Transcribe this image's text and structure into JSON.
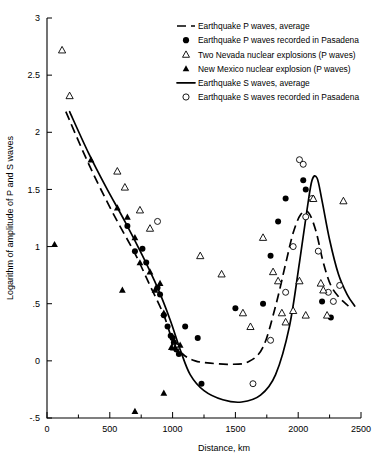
{
  "chart_data": {
    "type": "scatter",
    "title": "",
    "xlabel": "Distance, km",
    "ylabel": "Logarithm of amplitude of P and S waves",
    "xlim": [
      0,
      2500
    ],
    "ylim": [
      -0.5,
      3
    ],
    "xticks": [
      0,
      500,
      1000,
      1500,
      2000,
      2500
    ],
    "xtick_labels": [
      "0",
      "500",
      "1000",
      "1500",
      "2000",
      "2500"
    ],
    "xminor_step": 250,
    "yticks": [
      -0.5,
      0,
      0.5,
      1,
      1.5,
      2,
      2.5,
      3
    ],
    "ytick_labels": [
      "-.5",
      "0",
      ".5",
      "1",
      "1.5",
      "2",
      "2.5",
      "3"
    ],
    "grid": false,
    "legend_position": "top-right",
    "legend": [
      {
        "key": "p-average",
        "marker": "dashed-line",
        "label": "Earthquake P waves, average"
      },
      {
        "key": "p-pasadena",
        "marker": "filled-circle",
        "label": "Earthquake P waves recorded in Pasadena"
      },
      {
        "key": "nevada",
        "marker": "open-triangle",
        "label": "Two Nevada nuclear explosions (P waves)"
      },
      {
        "key": "new-mexico",
        "marker": "filled-triangle",
        "label": "New Mexico nuclear explosion (P waves)"
      },
      {
        "key": "s-average",
        "marker": "solid-line",
        "label": "Earthquake S waves, average"
      },
      {
        "key": "s-pasadena",
        "marker": "open-circle",
        "label": "Earthquake S waves recorded in Pasadena"
      }
    ],
    "series": [
      {
        "name": "Earthquake P waves, average",
        "key": "p-average",
        "type": "line",
        "style": "dashed",
        "points": [
          [
            150,
            2.18
          ],
          [
            300,
            1.8
          ],
          [
            420,
            1.52
          ],
          [
            560,
            1.22
          ],
          [
            700,
            0.94
          ],
          [
            820,
            0.66
          ],
          [
            930,
            0.4
          ],
          [
            1000,
            0.18
          ],
          [
            1080,
            0.06
          ],
          [
            1180,
            0.0
          ],
          [
            1300,
            -0.02
          ],
          [
            1450,
            -0.03
          ],
          [
            1600,
            -0.01
          ],
          [
            1720,
            0.12
          ],
          [
            1820,
            0.48
          ],
          [
            1900,
            0.85
          ],
          [
            1960,
            1.12
          ],
          [
            2020,
            1.28
          ],
          [
            2080,
            1.3
          ],
          [
            2140,
            1.14
          ],
          [
            2200,
            0.86
          ],
          [
            2260,
            0.66
          ],
          [
            2330,
            0.55
          ],
          [
            2400,
            0.48
          ]
        ]
      },
      {
        "name": "Earthquake S waves, average",
        "key": "s-average",
        "type": "line",
        "style": "solid",
        "points": [
          [
            180,
            2.18
          ],
          [
            330,
            1.82
          ],
          [
            470,
            1.52
          ],
          [
            620,
            1.22
          ],
          [
            760,
            0.92
          ],
          [
            880,
            0.64
          ],
          [
            980,
            0.36
          ],
          [
            1060,
            0.1
          ],
          [
            1140,
            -0.12
          ],
          [
            1250,
            -0.26
          ],
          [
            1400,
            -0.34
          ],
          [
            1550,
            -0.36
          ],
          [
            1700,
            -0.3
          ],
          [
            1820,
            -0.12
          ],
          [
            1930,
            0.3
          ],
          [
            2010,
            0.86
          ],
          [
            2070,
            1.32
          ],
          [
            2110,
            1.58
          ],
          [
            2150,
            1.6
          ],
          [
            2190,
            1.4
          ],
          [
            2250,
            1.06
          ],
          [
            2320,
            0.76
          ],
          [
            2390,
            0.58
          ],
          [
            2450,
            0.48
          ]
        ]
      },
      {
        "name": "Earthquake P waves recorded in Pasadena",
        "key": "p-pasadena",
        "type": "scatter",
        "marker": "filled-circle",
        "points": [
          [
            640,
            1.18
          ],
          [
            700,
            0.96
          ],
          [
            760,
            0.98
          ],
          [
            790,
            0.86
          ],
          [
            880,
            0.64
          ],
          [
            900,
            0.58
          ],
          [
            930,
            0.4
          ],
          [
            960,
            0.3
          ],
          [
            985,
            0.22
          ],
          [
            1000,
            0.2
          ],
          [
            1010,
            0.16
          ],
          [
            1015,
            0.14
          ],
          [
            1030,
            0.1
          ],
          [
            1050,
            0.06
          ],
          [
            1100,
            0.3
          ],
          [
            1200,
            0.2
          ],
          [
            1230,
            -0.2
          ],
          [
            1500,
            0.46
          ],
          [
            1720,
            0.5
          ],
          [
            1780,
            0.92
          ],
          [
            1840,
            1.22
          ],
          [
            1900,
            1.42
          ],
          [
            2040,
            1.58
          ],
          [
            2060,
            1.5
          ],
          [
            2190,
            0.52
          ],
          [
            2260,
            0.38
          ]
        ]
      },
      {
        "name": "Earthquake S waves recorded in Pasadena",
        "key": "s-pasadena",
        "type": "scatter",
        "marker": "open-circle",
        "points": [
          [
            880,
            1.22
          ],
          [
            1030,
            0.12
          ],
          [
            1640,
            -0.2
          ],
          [
            1780,
            0.18
          ],
          [
            1900,
            0.6
          ],
          [
            1960,
            1.0
          ],
          [
            2010,
            1.76
          ],
          [
            2040,
            1.72
          ],
          [
            2060,
            1.26
          ],
          [
            2110,
            1.42
          ],
          [
            2160,
            0.96
          ],
          [
            2240,
            0.6
          ],
          [
            2280,
            0.52
          ],
          [
            2330,
            0.66
          ]
        ]
      },
      {
        "name": "Two Nevada nuclear explosions (P waves)",
        "key": "nevada",
        "type": "scatter",
        "marker": "open-triangle",
        "points": [
          [
            120,
            2.72
          ],
          [
            180,
            2.32
          ],
          [
            560,
            1.66
          ],
          [
            620,
            1.52
          ],
          [
            740,
            1.32
          ],
          [
            820,
            1.16
          ],
          [
            1010,
            0.12
          ],
          [
            1220,
            0.92
          ],
          [
            1390,
            0.76
          ],
          [
            1560,
            0.42
          ],
          [
            1620,
            0.3
          ],
          [
            1720,
            1.08
          ],
          [
            1800,
            0.78
          ],
          [
            1840,
            0.7
          ],
          [
            1870,
            0.42
          ],
          [
            1900,
            0.34
          ],
          [
            1960,
            0.44
          ],
          [
            2010,
            0.7
          ],
          [
            2060,
            0.4
          ],
          [
            2120,
            1.42
          ],
          [
            2180,
            0.68
          ],
          [
            2200,
            0.62
          ],
          [
            2360,
            1.4
          ],
          [
            2230,
            0.4
          ]
        ]
      },
      {
        "name": "New Mexico nuclear explosion (P waves)",
        "key": "new-mexico",
        "type": "scatter",
        "marker": "filled-triangle",
        "points": [
          [
            60,
            1.02
          ],
          [
            350,
            1.76
          ],
          [
            560,
            1.34
          ],
          [
            640,
            1.26
          ],
          [
            700,
            1.08
          ],
          [
            740,
            0.86
          ],
          [
            820,
            0.78
          ],
          [
            860,
            0.62
          ],
          [
            900,
            0.68
          ],
          [
            930,
            0.42
          ],
          [
            990,
            0.12
          ],
          [
            1020,
            0.12
          ],
          [
            1060,
            0.14
          ],
          [
            930,
            -0.28
          ],
          [
            700,
            -0.44
          ],
          [
            600,
            0.62
          ]
        ]
      }
    ]
  }
}
